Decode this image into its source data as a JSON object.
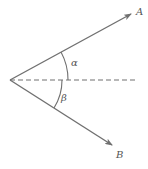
{
  "diagram": {
    "vertex": {
      "x": 10,
      "y": 80
    },
    "vectors": [
      {
        "name": "A",
        "label": "A",
        "tip": {
          "x": 132,
          "y": 13
        }
      },
      {
        "name": "B",
        "label": "B",
        "tip": {
          "x": 113,
          "y": 146
        }
      }
    ],
    "reference_line": {
      "style": "dashed",
      "x_end": 135
    },
    "angles": [
      {
        "name": "alpha",
        "label": "α",
        "between": [
          "A",
          "reference"
        ]
      },
      {
        "name": "beta",
        "label": "β",
        "between": [
          "reference",
          "B"
        ]
      }
    ],
    "colors": {
      "stroke": "#707070",
      "text": "#555555",
      "background": "#ffffff"
    }
  }
}
